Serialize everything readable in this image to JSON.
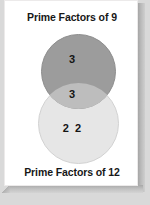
{
  "diagram": {
    "type": "venn-2-set",
    "top_title": "Prime Factors of 9",
    "bottom_title": "Prime Factors of 12",
    "regions": {
      "top_only": "3",
      "intersection": "3",
      "bottom_only": "2  2"
    },
    "colors": {
      "top_circle": "#9c9c9c",
      "bottom_circle": "#e6e6e6",
      "intersection": "#bdbdbd",
      "card": "#ffffff",
      "backdrop": "#d9d9d9",
      "text": "#141414"
    }
  }
}
